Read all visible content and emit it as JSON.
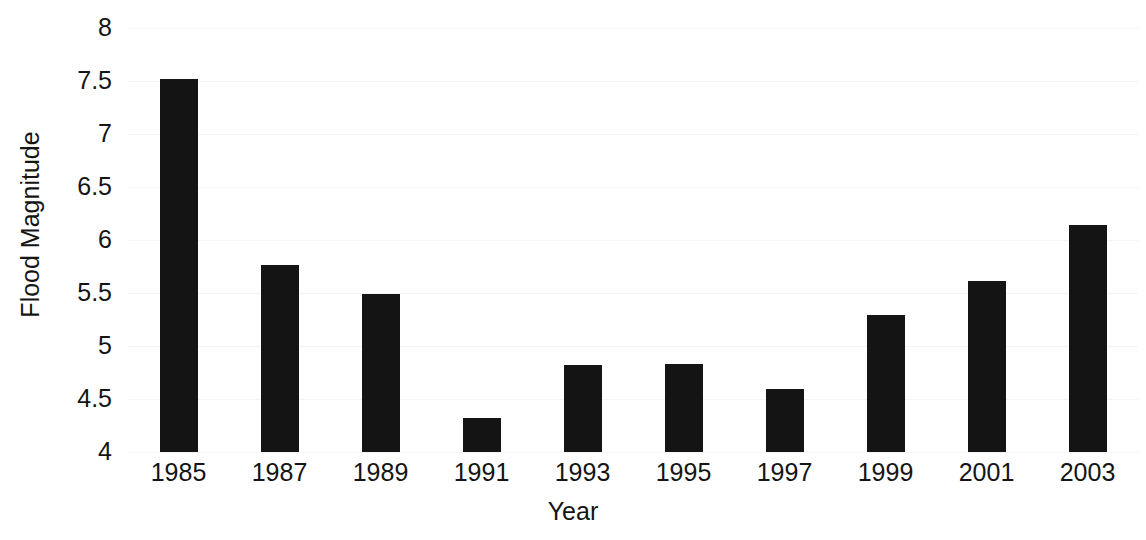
{
  "chart_data": {
    "type": "bar",
    "title": "",
    "xlabel": "Year",
    "ylabel": "Flood Magnitude",
    "categories": [
      "1985",
      "1987",
      "1989",
      "1991",
      "1993",
      "1995",
      "1997",
      "1999",
      "2001",
      "2003"
    ],
    "values": [
      7.52,
      5.76,
      5.49,
      4.32,
      4.82,
      4.83,
      4.59,
      5.29,
      5.61,
      6.14
    ],
    "ylim": [
      4,
      8
    ],
    "yticks": [
      4,
      4.5,
      5,
      5.5,
      6,
      6.5,
      7,
      7.5,
      8
    ],
    "ytick_labels": [
      "4",
      "4.5",
      "5",
      "5.5",
      "6",
      "6.5",
      "7",
      "7.5",
      "8"
    ],
    "grid": true,
    "legend": false,
    "bar_color": "#141414",
    "background_color": "#ffffff",
    "axis_text_color": "#141414",
    "gridline_color": "#f4f4f4"
  }
}
